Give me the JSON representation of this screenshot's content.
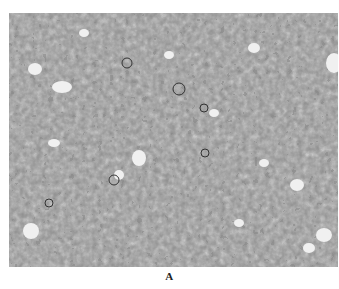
{
  "figure": {
    "panel_label": "A",
    "image": {
      "description": "grayscale histology micrograph of densely packed cells with dark nuclei and scattered clear vacuoles",
      "tone_colors": {
        "background_stroma": "#8a8a8a",
        "nuclei": "#1e1e1e",
        "vacuoles": "#f2f2f2",
        "cytoplasm": "#a8a8a8"
      }
    }
  }
}
